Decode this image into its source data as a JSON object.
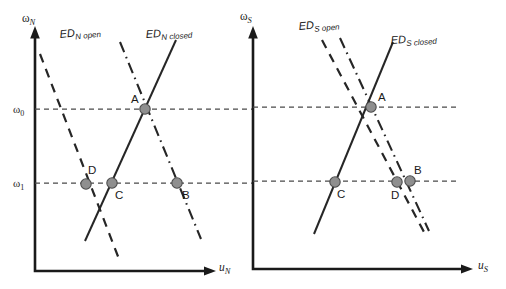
{
  "figure": {
    "type": "economics-diagram",
    "width": 506,
    "height": 289,
    "background_color": "#ffffff",
    "line_color": "#262626",
    "marker_fill_color": "#8f8f8f",
    "marker_stroke_color": "#4d4d4d",
    "reference_line_color": "#4a4a4a"
  },
  "panels": [
    {
      "id": "north",
      "y_axis_label": "ω",
      "y_axis_subscript": "N",
      "x_axis_label": "u",
      "x_axis_subscript": "N",
      "tick_labels": [
        {
          "text": "ω",
          "sub": "0",
          "x": 14,
          "y": 112
        },
        {
          "text": "ω",
          "sub": "1",
          "x": 14,
          "y": 186
        }
      ],
      "curves": [
        {
          "name": "ED_N_open",
          "label": "ED",
          "label_sub": "N open",
          "style": "dashed",
          "label_x": 60,
          "label_y": 38,
          "x1": 40,
          "y1": 54,
          "x2": 119,
          "y2": 259
        },
        {
          "name": "ED_N_closed",
          "label": "ED",
          "label_sub": "N closed",
          "style": "solid",
          "label_x": 146,
          "label_y": 38,
          "x1": 85,
          "y1": 241,
          "x2": 176,
          "y2": 40
        },
        {
          "name": "ED_N_dashdot",
          "label": "",
          "label_sub": "",
          "style": "dashdot",
          "label_x": 0,
          "label_y": 0,
          "x1": 120,
          "y1": 42,
          "x2": 201,
          "y2": 239
        }
      ],
      "points": [
        {
          "id": "A",
          "label": "A",
          "x": 145,
          "y": 109,
          "label_x": 131,
          "label_y": 103
        },
        {
          "id": "B",
          "label": "B",
          "x": 177,
          "y": 183,
          "label_x": 182,
          "label_y": 199
        },
        {
          "id": "C",
          "label": "C",
          "x": 112,
          "y": 183,
          "label_x": 115,
          "label_y": 199
        },
        {
          "id": "D",
          "label": "D",
          "x": 86,
          "y": 184,
          "label_x": 88,
          "label_y": 174
        }
      ],
      "reference_lines": [
        {
          "name": "omega-0-line",
          "y": 109,
          "x1": 35,
          "x2": 254
        },
        {
          "name": "omega-1-line",
          "y": 183,
          "x1": 35,
          "x2": 254
        }
      ]
    },
    {
      "id": "south",
      "y_axis_label": "ω",
      "y_axis_subscript": "S",
      "x_axis_label": "u",
      "x_axis_subscript": "S",
      "tick_labels": [],
      "curves": [
        {
          "name": "ED_S_open",
          "label": "ED",
          "label_sub": "S open",
          "style": "dashed",
          "label_x": 299,
          "label_y": 30,
          "x1": 322,
          "y1": 40,
          "x2": 424,
          "y2": 232
        },
        {
          "name": "ED_S_closed",
          "label": "ED",
          "label_sub": "S closed",
          "style": "solid",
          "label_x": 391,
          "label_y": 44,
          "x1": 314,
          "y1": 234,
          "x2": 393,
          "y2": 42
        },
        {
          "name": "ED_S_dashdot",
          "label": "",
          "label_sub": "",
          "style": "dashdot",
          "label_x": 0,
          "label_y": 0,
          "x1": 340,
          "y1": 38,
          "x2": 429,
          "y2": 231
        }
      ],
      "points": [
        {
          "id": "A",
          "label": "A",
          "x": 371,
          "y": 107,
          "label_x": 378,
          "label_y": 101
        },
        {
          "id": "B",
          "label": "B",
          "x": 410,
          "y": 181,
          "label_x": 414,
          "label_y": 174
        },
        {
          "id": "C",
          "label": "C",
          "x": 335,
          "y": 182,
          "label_x": 337,
          "label_y": 198
        },
        {
          "id": "D",
          "label": "D",
          "x": 397,
          "y": 182,
          "label_x": 393,
          "label_y": 199
        }
      ],
      "reference_lines": [
        {
          "name": "omega-0-line",
          "y": 107,
          "x1": 253,
          "x2": 460
        },
        {
          "name": "omega-1-line",
          "y": 181,
          "x1": 253,
          "x2": 460
        }
      ]
    }
  ]
}
